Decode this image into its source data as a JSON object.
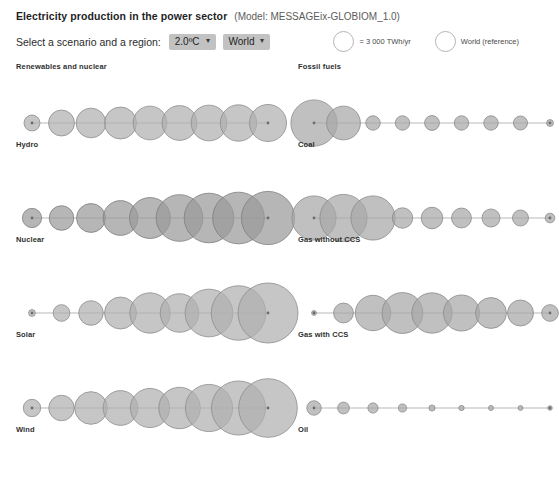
{
  "header": {
    "title": "Electricity production in the power sector",
    "model": "(Model: MESSAGEix-GLOBIOM_1.0)",
    "control_label": "Select a scenario and a region:",
    "scenario_value": "2.0ºC",
    "region_value": "World",
    "caret": "⌄"
  },
  "legend": {
    "size_text": "= 3 000 TWh/yr",
    "reference_text": "World (reference)"
  },
  "sections": {
    "left_heading": "Renewables and nuclear",
    "right_heading": "Fossil fuels"
  },
  "colors": {
    "renewable_fill": "#b0b0b0",
    "renewable_stroke": "#8d8d8d",
    "nuclear_fill": "#9a9a9a",
    "nuclear_stroke": "#7d7d7d",
    "fossil_fill": "#a8a8a8",
    "fossil_stroke": "#8a8a8a",
    "axis": "#9b9b9b",
    "text": "#2f2f2f"
  },
  "chart_data": {
    "type": "scatter",
    "title": "Electricity production in the power sector",
    "subtitle": "(Model: MESSAGEix-GLOBIOM_1.0)",
    "scenario": "2.0ºC",
    "region": "World",
    "size_legend": "= 3 000 TWh/yr",
    "size_legend_value": 3000,
    "unit": "TWh/yr",
    "xlabel": "",
    "ylabel": "",
    "grid": false,
    "legend_position": "top-right",
    "encoding": "circle area proportional to electricity production",
    "n_points_per_series": 9,
    "series": [
      {
        "name": "Hydro",
        "group": "Renewables and nuclear",
        "values": [
          1100,
          2900,
          3800,
          4400,
          4900,
          5200,
          5500,
          5700,
          5900
        ]
      },
      {
        "name": "Nuclear",
        "group": "Renewables and nuclear",
        "values": [
          1600,
          2600,
          3600,
          5200,
          7200,
          9400,
          10600,
          11500,
          12200
        ]
      },
      {
        "name": "Solar",
        "group": "Renewables and nuclear",
        "values": [
          200,
          1200,
          2600,
          4400,
          7000,
          6400,
          9800,
          12800,
          15500
        ]
      },
      {
        "name": "Wind",
        "group": "Renewables and nuclear",
        "values": [
          1300,
          2800,
          4600,
          5200,
          6600,
          7400,
          9600,
          12600,
          14800
        ]
      },
      {
        "name": "Coal",
        "group": "Fossil fuels",
        "values": [
          9200,
          4900,
          900,
          900,
          950,
          900,
          900,
          850,
          200
        ]
      },
      {
        "name": "Gas without CCS",
        "group": "Fossil fuels",
        "values": [
          8400,
          9600,
          8400,
          1800,
          2000,
          1700,
          1400,
          1100,
          400
        ]
      },
      {
        "name": "Gas with CCS",
        "group": "Fossil fuels",
        "values": [
          100,
          1700,
          5400,
          7200,
          7000,
          5600,
          4100,
          2900,
          1200
        ]
      },
      {
        "name": "Oil",
        "group": "Fossil fuels",
        "values": [
          900,
          600,
          450,
          280,
          160,
          120,
          110,
          100,
          90
        ]
      }
    ]
  }
}
